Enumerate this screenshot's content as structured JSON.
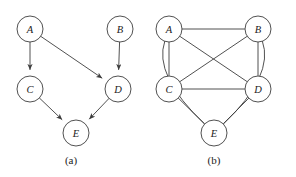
{
  "figure": {
    "width": 296,
    "height": 177,
    "background": "#ffffff",
    "stroke_color": "#3d3d3d",
    "label_color": "#1b1b1b",
    "node_fill": "#ffffff",
    "node_radius": 13
  },
  "panels": [
    {
      "id": "a",
      "caption": "(a)",
      "caption_x": 71,
      "caption_y": 160,
      "graph_type": "directed",
      "nodes": [
        {
          "id": "A",
          "label": "A",
          "x": 30,
          "y": 29
        },
        {
          "id": "B",
          "label": "B",
          "x": 120,
          "y": 29
        },
        {
          "id": "C",
          "label": "C",
          "x": 30,
          "y": 89
        },
        {
          "id": "D",
          "label": "D",
          "x": 118,
          "y": 89
        },
        {
          "id": "E",
          "label": "E",
          "x": 76,
          "y": 133
        }
      ],
      "edges": [
        {
          "from": "A",
          "to": "C",
          "directed": true,
          "style": "straight"
        },
        {
          "from": "A",
          "to": "D",
          "directed": true,
          "style": "straight"
        },
        {
          "from": "B",
          "to": "D",
          "directed": true,
          "style": "straight"
        },
        {
          "from": "C",
          "to": "E",
          "directed": true,
          "style": "straight"
        },
        {
          "from": "D",
          "to": "E",
          "directed": true,
          "style": "straight"
        }
      ]
    },
    {
      "id": "b",
      "caption": "(b)",
      "caption_x": 214,
      "caption_y": 160,
      "graph_type": "undirected",
      "nodes": [
        {
          "id": "A",
          "label": "A",
          "x": 169,
          "y": 29
        },
        {
          "id": "B",
          "label": "B",
          "x": 258,
          "y": 29
        },
        {
          "id": "C",
          "label": "C",
          "x": 169,
          "y": 89
        },
        {
          "id": "D",
          "label": "D",
          "x": 258,
          "y": 89
        },
        {
          "id": "E",
          "label": "E",
          "x": 214,
          "y": 133
        }
      ],
      "edges": [
        {
          "from": "A",
          "to": "B",
          "directed": false,
          "style": "straight"
        },
        {
          "from": "A",
          "to": "C",
          "directed": false,
          "style": "straight"
        },
        {
          "from": "A",
          "to": "D",
          "directed": false,
          "style": "straight"
        },
        {
          "from": "B",
          "to": "C",
          "directed": false,
          "style": "straight"
        },
        {
          "from": "B",
          "to": "D",
          "directed": false,
          "style": "straight"
        },
        {
          "from": "C",
          "to": "D",
          "directed": false,
          "style": "straight"
        },
        {
          "from": "C",
          "to": "E",
          "directed": false,
          "style": "straight"
        },
        {
          "from": "D",
          "to": "E",
          "directed": false,
          "style": "straight"
        },
        {
          "from": "A",
          "to": "E",
          "directed": false,
          "style": "curve-left",
          "bow": 42
        },
        {
          "from": "B",
          "to": "E",
          "directed": false,
          "style": "curve-right",
          "bow": 42
        }
      ]
    }
  ]
}
